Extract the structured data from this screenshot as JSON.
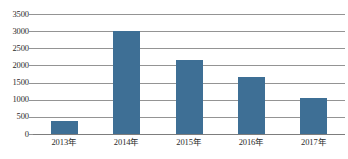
{
  "chart_data": {
    "type": "bar",
    "title": "",
    "subtitle": "",
    "xlabel": "",
    "ylabel": "",
    "categories": [
      "2013年",
      "2014年",
      "2015年",
      "2016年",
      "2017年"
    ],
    "values": [
      380,
      3000,
      2150,
      1650,
      1050
    ],
    "series": [
      {
        "name": "",
        "values": [
          380,
          3000,
          2150,
          1650,
          1050
        ]
      }
    ],
    "ylim": [
      0,
      3500
    ],
    "y_ticks": [
      0,
      500,
      1000,
      1500,
      2000,
      2500,
      3000,
      3500
    ],
    "y_tick_labels": [
      "0",
      "500",
      "1000",
      "1500",
      "2000",
      "2500",
      "3000",
      "3500"
    ],
    "grid": true,
    "grid_axis": "y",
    "legend": false,
    "legend_position": "none",
    "bar_color": "#3e6f95",
    "grid_color": "#949494",
    "background_color": "#ffffff",
    "annotations": []
  }
}
